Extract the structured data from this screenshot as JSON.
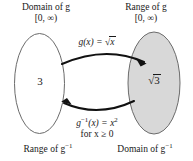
{
  "diagram": {
    "corner_labels": {
      "top_left_line1": "Domain of g",
      "top_left_line2": "[0, ∞)",
      "top_right_line1": "Range of g",
      "top_right_line2": "[0, ∞)",
      "bottom_left": "Range of g",
      "bottom_left_sup": "−1",
      "bottom_right": "Domain of g",
      "bottom_right_sup": "−1"
    },
    "forward_arrow": {
      "label_fn": "g(x)",
      "label_eq": "=",
      "label_radicand": "x",
      "direction": "left-to-right"
    },
    "inverse_arrow": {
      "label_fn": "g",
      "label_fn_sup": "−1",
      "label_arg": "(x)",
      "label_eq": "=",
      "label_rhs": "x",
      "label_rhs_sup": "2",
      "condition": "for x ≥ 0",
      "direction": "right-to-left"
    },
    "sets": [
      {
        "id": "domain-set",
        "value": "3",
        "fill": "#ffffff",
        "stroke": "#6b6b6b"
      },
      {
        "id": "range-set",
        "value": "3",
        "value_is_radical": "true",
        "fill": "#d8d8d8",
        "stroke": "#6b6b6b"
      }
    ],
    "colors": {
      "background": "#ffffff",
      "text": "#1a1a1a",
      "arrow": "#111111",
      "ellipse_stroke": "#6b6b6b",
      "shaded_fill": "#d8d8d8"
    }
  }
}
